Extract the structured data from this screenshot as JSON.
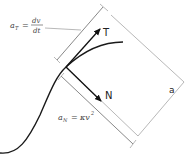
{
  "diagram": {
    "labels": {
      "tangent_vector": "T",
      "normal_vector": "N",
      "acceleration": "a",
      "a_T_base": "a",
      "a_T_sub": "T",
      "a_T_eq": "=",
      "a_T_num": "dv",
      "a_T_den": "dt",
      "a_N_base": "a",
      "a_N_sub": "N",
      "a_N_eq": "=",
      "a_N_rhs": "κv",
      "a_N_exp": "2"
    },
    "colors": {
      "curve": "#1a1a1a",
      "vectors": "#111111",
      "construction_lines": "#9a9a9a",
      "text": "#444444"
    }
  }
}
